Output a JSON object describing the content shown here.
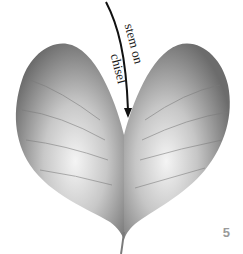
{
  "illustration": {
    "subject": "heart-shaped leaf",
    "annotation": {
      "line1": "stem on",
      "line2": "chisel"
    },
    "step_number": "5",
    "colors": {
      "leaf_dark": "#6e6e6e",
      "leaf_light": "#f2f2f2",
      "arrow": "#111111",
      "step_number": "#9a9a9a"
    }
  }
}
